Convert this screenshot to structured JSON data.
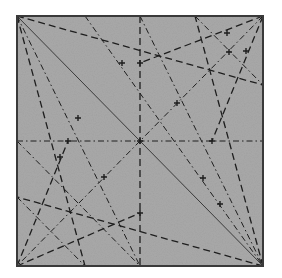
{
  "diagram": {
    "type": "origami-crease-pattern",
    "paper_color": "#a9a9a9",
    "border_color": "#3a3a3a",
    "line_color": "#1e1e1e",
    "square": {
      "x1": 17,
      "y1": 16,
      "x2": 263,
      "y2": 266
    },
    "legend": {
      "solid": "existing crease / diagonal",
      "dashed": "valley fold",
      "dash-dot": "mountain fold"
    },
    "lines": [
      {
        "style": "solid",
        "x1": 17,
        "y1": 16,
        "x2": 263,
        "y2": 266
      },
      {
        "style": "dashdot",
        "x1": 17,
        "y1": 141,
        "x2": 263,
        "y2": 141
      },
      {
        "style": "dashed",
        "x1": 140,
        "y1": 16,
        "x2": 140,
        "y2": 266
      },
      {
        "style": "dashed",
        "x1": 17,
        "y1": 16,
        "x2": 263,
        "y2": 85
      },
      {
        "style": "dashed",
        "x1": 17,
        "y1": 16,
        "x2": 85,
        "y2": 266
      },
      {
        "style": "dashed",
        "x1": 263,
        "y1": 266,
        "x2": 195,
        "y2": 16
      },
      {
        "style": "dashed",
        "x1": 263,
        "y1": 266,
        "x2": 17,
        "y2": 197
      },
      {
        "style": "dashdot",
        "x1": 263,
        "y1": 16,
        "x2": 17,
        "y2": 266
      },
      {
        "style": "dashed",
        "x1": 263,
        "y1": 16,
        "x2": 85,
        "y2": 16
      },
      {
        "style": "dashed",
        "x1": 263,
        "y1": 16,
        "x2": 140,
        "y2": 63
      },
      {
        "style": "dashed",
        "x1": 263,
        "y1": 16,
        "x2": 212,
        "y2": 141
      },
      {
        "style": "dashed",
        "x1": 17,
        "y1": 266,
        "x2": 140,
        "y2": 213
      },
      {
        "style": "dashed",
        "x1": 17,
        "y1": 266,
        "x2": 68,
        "y2": 141
      },
      {
        "style": "dashdot",
        "x1": 85,
        "y1": 16,
        "x2": 263,
        "y2": 266
      },
      {
        "style": "dashdot",
        "x1": 195,
        "y1": 16,
        "x2": 263,
        "y2": 85
      },
      {
        "style": "dashdot",
        "x1": 17,
        "y1": 197,
        "x2": 85,
        "y2": 266
      },
      {
        "style": "dashdot",
        "x1": 17,
        "y1": 16,
        "x2": 140,
        "y2": 266
      },
      {
        "style": "dashdot",
        "x1": 140,
        "y1": 16,
        "x2": 263,
        "y2": 266
      },
      {
        "style": "dashdot",
        "x1": 17,
        "y1": 141,
        "x2": 140,
        "y2": 266
      }
    ],
    "vertex_marks": [
      {
        "x": 140,
        "y": 141
      },
      {
        "x": 68,
        "y": 141
      },
      {
        "x": 212,
        "y": 141
      },
      {
        "x": 140,
        "y": 63
      },
      {
        "x": 140,
        "y": 213
      },
      {
        "x": 177,
        "y": 103
      },
      {
        "x": 104,
        "y": 177
      },
      {
        "x": 227,
        "y": 33
      },
      {
        "x": 229,
        "y": 52
      },
      {
        "x": 246,
        "y": 51
      },
      {
        "x": 220,
        "y": 204
      },
      {
        "x": 60,
        "y": 157
      },
      {
        "x": 78,
        "y": 118
      },
      {
        "x": 203,
        "y": 178
      },
      {
        "x": 122,
        "y": 63
      }
    ]
  }
}
